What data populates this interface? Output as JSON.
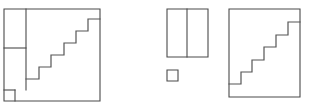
{
  "diagram": {
    "canvas": {
      "width": 313,
      "height": 111,
      "background": "#ffffff"
    },
    "stroke_color": "#4a4a4a",
    "stair_stroke_color": "#555555",
    "fill_color": "#ffffff",
    "figures": [
      {
        "id": "left-figure",
        "name": "source-square-with-staircase",
        "label": "",
        "bounds": {
          "x": 4,
          "y": 9,
          "width": 96,
          "height": 92
        },
        "outline_points": "4,9 100,9 100,101 4,101",
        "parts": [
          {
            "name": "upper-left-rectangle",
            "points": "4,9 26,9 26,48 4,48"
          },
          {
            "name": "lower-left-rectangle",
            "points": "4,48 26,48 26,90 4,90"
          },
          {
            "name": "corner-small-square",
            "points": "4,90 15,90 15,101 4,101"
          }
        ],
        "dividers": [
          {
            "name": "vertical-divider",
            "points": "26,9 26,90"
          },
          {
            "name": "horizontal-divider",
            "points": "4,48 26,48"
          },
          {
            "name": "small-square-top",
            "points": "4,90 15,90"
          },
          {
            "name": "small-square-right",
            "points": "15,90 15,101"
          }
        ],
        "staircase": {
          "name": "staircase-polyline",
          "steps": 6,
          "points": "26,79 39,79 39,67 51,67 51,55 64,55 64,43 76,43 76,31 88,31 88,19 100,19"
        }
      },
      {
        "id": "middle-figure",
        "name": "rectangle-pieces",
        "label": "",
        "bounds": {
          "x": 167,
          "y": 9,
          "width": 41,
          "height": 48
        },
        "outline_points": "167,9 208,9 208,57 167,57",
        "dividers": [
          {
            "name": "vertical-divider",
            "points": "187,9 187,57"
          }
        ],
        "sub_square": {
          "name": "small-square-piece",
          "bounds": {
            "x": 167,
            "y": 70,
            "width": 11,
            "height": 11
          },
          "points": "167,70 178,70 178,81 167,81"
        }
      },
      {
        "id": "right-figure",
        "name": "result-square-with-staircase",
        "label": "",
        "bounds": {
          "x": 229,
          "y": 9,
          "width": 71,
          "height": 88
        },
        "outline_points": "229,9 300,9 300,97 229,97",
        "staircase": {
          "name": "staircase-polyline",
          "steps": 6,
          "points": "229,84 241,84 241,72 252,72 252,60 264,60 264,47 276,47 276,35 288,35 288,22 300,22"
        }
      }
    ]
  }
}
